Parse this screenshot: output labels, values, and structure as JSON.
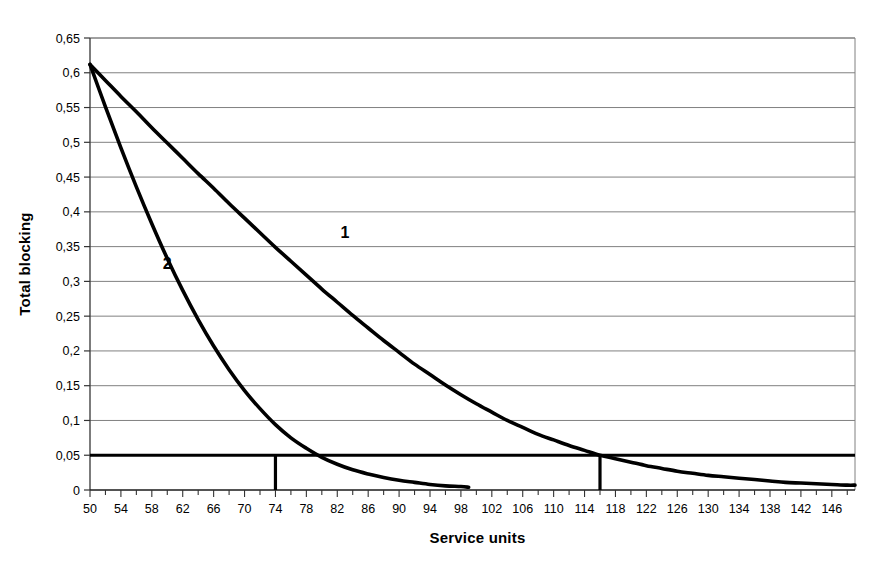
{
  "chart_data": {
    "type": "line",
    "title": "",
    "xlabel": "Service units",
    "ylabel": "Total blocking",
    "xlim": [
      50,
      149
    ],
    "ylim": [
      0,
      0.65
    ],
    "grid": true,
    "legend_position": "inline-labels",
    "x_tick_labels": [
      "50",
      "54",
      "58",
      "62",
      "66",
      "70",
      "74",
      "78",
      "82",
      "86",
      "90",
      "94",
      "98",
      "102",
      "106",
      "110",
      "114",
      "118",
      "122",
      "126",
      "130",
      "134",
      "138",
      "142",
      "146"
    ],
    "x_tick_values": [
      50,
      54,
      58,
      62,
      66,
      70,
      74,
      78,
      82,
      86,
      90,
      94,
      98,
      102,
      106,
      110,
      114,
      118,
      122,
      126,
      130,
      134,
      138,
      142,
      146
    ],
    "x_minor_tick_step": 2,
    "y_tick_labels": [
      "0",
      "0,05",
      "0,1",
      "0,15",
      "0,2",
      "0,25",
      "0,3",
      "0,35",
      "0,4",
      "0,45",
      "0,5",
      "0,55",
      "0,6",
      "0,65"
    ],
    "y_tick_values": [
      0,
      0.05,
      0.1,
      0.15,
      0.2,
      0.25,
      0.3,
      0.35,
      0.4,
      0.45,
      0.5,
      0.55,
      0.6,
      0.65
    ],
    "decimal_separator": ",",
    "series": [
      {
        "name": "1",
        "label": "1",
        "label_x": 83,
        "label_y": 0.362,
        "color": "#000000",
        "x": [
          50,
          52,
          54,
          56,
          58,
          60,
          62,
          64,
          66,
          68,
          70,
          72,
          74,
          76,
          78,
          80,
          82,
          84,
          86,
          88,
          90,
          92,
          94,
          96,
          98,
          100,
          102,
          104,
          106,
          108,
          110,
          112,
          114,
          116,
          118,
          120,
          122,
          124,
          126,
          128,
          130,
          132,
          134,
          136,
          138,
          140,
          142,
          144,
          146,
          148,
          149
        ],
        "y": [
          0.612,
          0.589,
          0.566,
          0.544,
          0.521,
          0.499,
          0.477,
          0.455,
          0.434,
          0.412,
          0.391,
          0.37,
          0.349,
          0.329,
          0.309,
          0.289,
          0.27,
          0.251,
          0.233,
          0.215,
          0.198,
          0.181,
          0.166,
          0.151,
          0.137,
          0.124,
          0.112,
          0.1,
          0.09,
          0.08,
          0.072,
          0.064,
          0.057,
          0.05,
          0.045,
          0.04,
          0.035,
          0.031,
          0.027,
          0.024,
          0.021,
          0.019,
          0.017,
          0.015,
          0.013,
          0.011,
          0.01,
          0.009,
          0.008,
          0.007,
          0.007
        ]
      },
      {
        "name": "2",
        "label": "2",
        "label_x": 60,
        "label_y": 0.318,
        "color": "#000000",
        "x": [
          50,
          52,
          54,
          56,
          58,
          60,
          62,
          64,
          66,
          68,
          70,
          72,
          74,
          76,
          78,
          80,
          82,
          84,
          86,
          88,
          90,
          92,
          94,
          96,
          98,
          99
        ],
        "y": [
          0.612,
          0.551,
          0.492,
          0.436,
          0.383,
          0.333,
          0.287,
          0.245,
          0.207,
          0.173,
          0.143,
          0.117,
          0.094,
          0.075,
          0.06,
          0.047,
          0.037,
          0.029,
          0.023,
          0.018,
          0.014,
          0.011,
          0.008,
          0.006,
          0.005,
          0.004
        ]
      }
    ],
    "reference_lines": [
      {
        "name": "blocking-threshold",
        "orientation": "horizontal",
        "value": 0.05,
        "x_from": 50,
        "x_to": 149
      },
      {
        "name": "crossing-marker-curve-2",
        "orientation": "vertical",
        "value": 74,
        "y_from": 0,
        "y_to": 0.05
      },
      {
        "name": "crossing-marker-curve-1",
        "orientation": "vertical",
        "value": 116,
        "y_from": 0,
        "y_to": 0.05
      }
    ],
    "annotations": [
      {
        "text": "1",
        "x": 83,
        "y": 0.362
      },
      {
        "text": "2",
        "x": 60,
        "y": 0.318
      }
    ]
  }
}
